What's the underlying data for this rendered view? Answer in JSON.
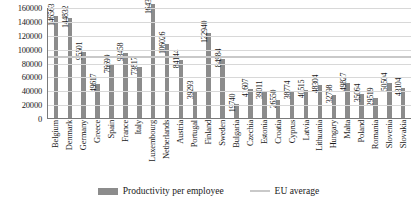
{
  "chart_data": {
    "type": "bar",
    "title": "",
    "xlabel": "",
    "ylabel": "",
    "ylim": [
      0,
      160000
    ],
    "ytick_step": 20000,
    "grid": true,
    "legend_position": "bottom",
    "categories": [
      "Belgium",
      "Denmark",
      "Germany",
      "Greece",
      "Spain",
      "France",
      "Italy",
      "Luxembourg",
      "Netherlands",
      "Austria",
      "Portugal",
      "Finland",
      "Sweden",
      "Bulgaria",
      "Czechia",
      "Estonia",
      "Croatia",
      "Cyprus",
      "Latvia",
      "Lithuania",
      "Hungary",
      "Malta",
      "Poland",
      "Romania",
      "Slovenia",
      "Slovakia"
    ],
    "values": [
      146563,
      144832,
      95501,
      49617,
      76699,
      93458,
      73817,
      164381,
      106026,
      84144,
      39293,
      122940,
      84984,
      19740,
      41607,
      39011,
      26550,
      38774,
      40515,
      48304,
      32798,
      49827,
      35064,
      29519,
      50504,
      43104
    ],
    "yticks": [
      "160000",
      "140000",
      "120000",
      "100000",
      "80000",
      "60000",
      "40000",
      "20000",
      "0"
    ],
    "series": [
      {
        "name": "Productivity per employee",
        "type": "bar",
        "color": "#8c8c8c",
        "values": [
          146563,
          144832,
          95501,
          49617,
          76699,
          93458,
          73817,
          164381,
          106026,
          84144,
          39293,
          122940,
          84984,
          19740,
          41607,
          39011,
          26550,
          38774,
          40515,
          48304,
          32798,
          49827,
          35064,
          29519,
          50504,
          43104
        ]
      },
      {
        "name": "EU average",
        "type": "line",
        "color": "#c9c9c9",
        "value": 91000
      }
    ],
    "legend": [
      {
        "label": "Productivity per employee",
        "marker": "bar",
        "color": "#8c8c8c"
      },
      {
        "label": "EU average",
        "marker": "line",
        "color": "#c9c9c9"
      }
    ]
  }
}
